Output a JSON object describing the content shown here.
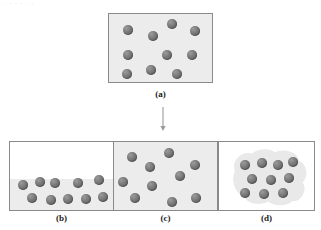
{
  "figure": {
    "title_remnant": "- - - - - -",
    "background_color": "#ffffff",
    "sphere_color": "#6f6f6f",
    "panel_fill_color": "#ececec",
    "panel_border_color": "#8a8a8a",
    "droplet_color": "#e8e8e8"
  },
  "panels": [
    {
      "id": "a",
      "caption": "(a)",
      "state": "gas",
      "filled": true,
      "sphere_count": 10,
      "x": 108,
      "y": 13,
      "w": 105,
      "h": 70,
      "caption_x": 108,
      "caption_y": 89,
      "caption_w": 105,
      "spheres": [
        {
          "cx": 19,
          "cy": 16,
          "r": 5.4
        },
        {
          "cx": 44,
          "cy": 22,
          "r": 5.4
        },
        {
          "cx": 63,
          "cy": 10,
          "r": 5.4
        },
        {
          "cx": 86,
          "cy": 17,
          "r": 5.4
        },
        {
          "cx": 19,
          "cy": 41,
          "r": 5.4
        },
        {
          "cx": 58,
          "cy": 41,
          "r": 5.4
        },
        {
          "cx": 83,
          "cy": 41,
          "r": 5.4
        },
        {
          "cx": 18,
          "cy": 60,
          "r": 5.4
        },
        {
          "cx": 42,
          "cy": 56,
          "r": 5.4
        },
        {
          "cx": 68,
          "cy": 60,
          "r": 5.4
        }
      ]
    },
    {
      "id": "b",
      "caption": "(b)",
      "state": "liquid-with-vapor",
      "filled": false,
      "liquid_level_pct": 45,
      "sphere_count": 10,
      "x": 9,
      "y": 141,
      "w": 105,
      "h": 70,
      "caption_x": 9,
      "caption_y": 213,
      "caption_w": 105,
      "spheres": [
        {
          "cx": 13,
          "cy": 43,
          "r": 5.4
        },
        {
          "cx": 30,
          "cy": 40,
          "r": 5.4
        },
        {
          "cx": 45,
          "cy": 41,
          "r": 5.4
        },
        {
          "cx": 68,
          "cy": 41,
          "r": 5.4
        },
        {
          "cx": 89,
          "cy": 38,
          "r": 5.4
        },
        {
          "cx": 22,
          "cy": 56,
          "r": 5.4
        },
        {
          "cx": 41,
          "cy": 58,
          "r": 5.4
        },
        {
          "cx": 58,
          "cy": 57,
          "r": 5.4
        },
        {
          "cx": 76,
          "cy": 57,
          "r": 5.4
        },
        {
          "cx": 93,
          "cy": 55,
          "r": 5.4
        }
      ]
    },
    {
      "id": "c",
      "caption": "(c)",
      "state": "supercritical-fluid",
      "filled": true,
      "sphere_count": 10,
      "x": 113,
      "y": 141,
      "w": 105,
      "h": 70,
      "caption_x": 113,
      "caption_y": 213,
      "caption_w": 105,
      "spheres": [
        {
          "cx": 18,
          "cy": 15,
          "r": 5.4
        },
        {
          "cx": 55,
          "cy": 11,
          "r": 5.4
        },
        {
          "cx": 36,
          "cy": 25,
          "r": 5.4
        },
        {
          "cx": 81,
          "cy": 23,
          "r": 5.4
        },
        {
          "cx": 9,
          "cy": 40,
          "r": 5.4
        },
        {
          "cx": 66,
          "cy": 34,
          "r": 5.4
        },
        {
          "cx": 38,
          "cy": 44,
          "r": 5.4
        },
        {
          "cx": 21,
          "cy": 56,
          "r": 5.4
        },
        {
          "cx": 58,
          "cy": 60,
          "r": 5.4
        },
        {
          "cx": 82,
          "cy": 56,
          "r": 5.4
        }
      ]
    },
    {
      "id": "d",
      "caption": "(d)",
      "state": "condensed-droplet",
      "filled": false,
      "sphere_count": 10,
      "x": 218,
      "y": 141,
      "w": 97,
      "h": 70,
      "caption_x": 218,
      "caption_y": 213,
      "caption_w": 97,
      "spheres": [
        {
          "cx": 26,
          "cy": 23,
          "r": 5.4
        },
        {
          "cx": 43,
          "cy": 21,
          "r": 5.4
        },
        {
          "cx": 59,
          "cy": 23,
          "r": 5.4
        },
        {
          "cx": 74,
          "cy": 20,
          "r": 5.4
        },
        {
          "cx": 33,
          "cy": 37,
          "r": 5.4
        },
        {
          "cx": 52,
          "cy": 38,
          "r": 5.4
        },
        {
          "cx": 70,
          "cy": 36,
          "r": 5.4
        },
        {
          "cx": 26,
          "cy": 51,
          "r": 5.4
        },
        {
          "cx": 45,
          "cy": 52,
          "r": 5.4
        },
        {
          "cx": 64,
          "cy": 51,
          "r": 5.4
        }
      ]
    }
  ],
  "arrow": {
    "name": "downward-arrow",
    "x": 163,
    "y_start": 107,
    "y_end": 131,
    "color": "#9a9a9a"
  }
}
